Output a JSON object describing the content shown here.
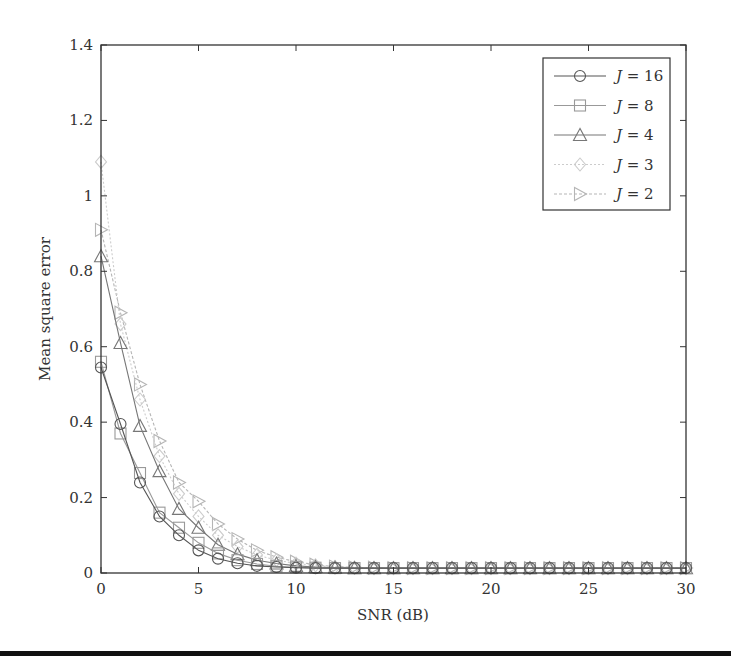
{
  "chart_data": {
    "type": "line",
    "title": "",
    "xlabel": "SNR (dB)",
    "ylabel": "Mean square error",
    "xlim": [
      0,
      30
    ],
    "ylim": [
      0,
      1.4
    ],
    "xticks": [
      0,
      5,
      10,
      15,
      20,
      25,
      30
    ],
    "yticks": [
      0,
      0.2,
      0.4,
      0.6,
      0.8,
      1,
      1.2,
      1.4
    ],
    "xtick_labels": [
      "0",
      "5",
      "10",
      "15",
      "20",
      "25",
      "30"
    ],
    "ytick_labels": [
      "0",
      "0.2",
      "0.4",
      "0.6",
      "0.8",
      "1",
      "1.2",
      "1.4"
    ],
    "grid": false,
    "legend_position": "upper right",
    "x": [
      0,
      1,
      2,
      3,
      4,
      5,
      6,
      7,
      8,
      9,
      10,
      11,
      12,
      13,
      14,
      15,
      16,
      17,
      18,
      19,
      20,
      21,
      22,
      23,
      24,
      25,
      26,
      27,
      28,
      29,
      30
    ],
    "series": [
      {
        "name": "J = 16",
        "marker": "circle",
        "color": "#555555",
        "dash": "",
        "values": [
          0.545,
          0.395,
          0.24,
          0.15,
          0.1,
          0.06,
          0.038,
          0.026,
          0.019,
          0.016,
          0.014,
          0.013,
          0.013,
          0.013,
          0.013,
          0.013,
          0.013,
          0.013,
          0.013,
          0.013,
          0.013,
          0.013,
          0.013,
          0.013,
          0.013,
          0.013,
          0.013,
          0.013,
          0.013,
          0.013,
          0.013
        ]
      },
      {
        "name": "J = 8",
        "marker": "square",
        "color": "#999999",
        "dash": "",
        "values": [
          0.56,
          0.37,
          0.265,
          0.16,
          0.12,
          0.08,
          0.052,
          0.034,
          0.024,
          0.018,
          0.015,
          0.014,
          0.013,
          0.013,
          0.013,
          0.013,
          0.013,
          0.013,
          0.013,
          0.013,
          0.013,
          0.013,
          0.013,
          0.013,
          0.013,
          0.013,
          0.013,
          0.013,
          0.013,
          0.013,
          0.013
        ]
      },
      {
        "name": "J = 4",
        "marker": "triangle-up",
        "color": "#777777",
        "dash": "",
        "values": [
          0.84,
          0.61,
          0.39,
          0.27,
          0.17,
          0.12,
          0.075,
          0.05,
          0.034,
          0.025,
          0.019,
          0.016,
          0.014,
          0.013,
          0.013,
          0.013,
          0.013,
          0.013,
          0.013,
          0.013,
          0.013,
          0.013,
          0.013,
          0.013,
          0.013,
          0.013,
          0.013,
          0.013,
          0.013,
          0.013,
          0.013
        ]
      },
      {
        "name": "J = 3",
        "marker": "diamond",
        "color": "#cccccc",
        "dash": "2,2",
        "values": [
          1.09,
          0.66,
          0.46,
          0.31,
          0.21,
          0.15,
          0.1,
          0.07,
          0.048,
          0.034,
          0.025,
          0.02,
          0.016,
          0.014,
          0.013,
          0.013,
          0.013,
          0.013,
          0.013,
          0.013,
          0.013,
          0.013,
          0.013,
          0.013,
          0.013,
          0.013,
          0.013,
          0.013,
          0.013,
          0.013,
          0.013
        ]
      },
      {
        "name": "J = 2",
        "marker": "triangle-right",
        "color": "#b5b5b5",
        "dash": "3,2",
        "values": [
          0.91,
          0.69,
          0.5,
          0.35,
          0.24,
          0.19,
          0.13,
          0.09,
          0.06,
          0.042,
          0.03,
          0.022,
          0.017,
          0.015,
          0.014,
          0.013,
          0.013,
          0.013,
          0.013,
          0.013,
          0.013,
          0.013,
          0.013,
          0.013,
          0.013,
          0.013,
          0.013,
          0.013,
          0.013,
          0.013,
          0.013
        ]
      }
    ]
  },
  "legend": {
    "items": [
      {
        "prefix": "J",
        "suffix": " = 16"
      },
      {
        "prefix": "J",
        "suffix": " = 8"
      },
      {
        "prefix": "J",
        "suffix": " = 4"
      },
      {
        "prefix": "J",
        "suffix": " = 3"
      },
      {
        "prefix": "J",
        "suffix": " = 2"
      }
    ]
  }
}
